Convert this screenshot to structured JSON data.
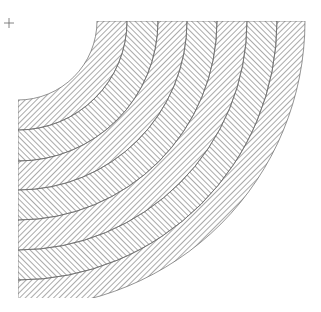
{
  "artwork": {
    "description": "Op-art concentric quarter-ring bands with alternating diagonal hatching",
    "center": [
      18,
      21
    ],
    "clip": {
      "x": 18,
      "y": 21,
      "w": 290,
      "h": 277
    },
    "stroke_color": "#555555",
    "background": "#ffffff",
    "rings": [
      {
        "inner": 79,
        "mid": 109,
        "outer": 140
      },
      {
        "inner": 140,
        "mid": 169,
        "outer": 199
      },
      {
        "inner": 199,
        "mid": 229,
        "outer": 259
      },
      {
        "inner": 259,
        "mid": 287,
        "outer": 287
      }
    ]
  },
  "marker": {
    "symbol": "+"
  }
}
